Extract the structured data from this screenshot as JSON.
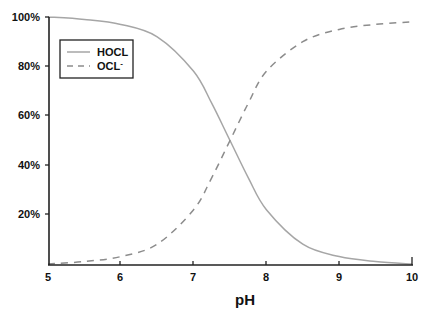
{
  "chart_data": {
    "type": "line",
    "title": "",
    "xlabel": "pH",
    "ylabel": "",
    "xlim": [
      5,
      10
    ],
    "ylim": [
      0,
      100
    ],
    "grid": false,
    "legend_position": "upper-left (inside)",
    "x_ticks": [
      "5",
      "6",
      "7",
      "8",
      "9",
      "10"
    ],
    "y_ticks": [
      "20%",
      "40%",
      "60%",
      "80%",
      "100%"
    ],
    "x": [
      5.0,
      5.5,
      6.0,
      6.5,
      7.0,
      7.25,
      7.5,
      7.75,
      8.0,
      8.5,
      9.0,
      9.5,
      10.0
    ],
    "series": [
      {
        "name": "HOCL",
        "style": "solid",
        "color": "#a6a6a6",
        "values": [
          100,
          99,
          97,
          92,
          78,
          65,
          50,
          35,
          22,
          8,
          3,
          1,
          0
        ]
      },
      {
        "name": "OCL-",
        "style": "dashed",
        "color": "#8c8c8c",
        "values": [
          0,
          1,
          3,
          8,
          22,
          35,
          50,
          65,
          78,
          90,
          95,
          97,
          98
        ]
      }
    ]
  },
  "legend": {
    "items": [
      {
        "label": "HOCL",
        "style": "solid"
      },
      {
        "label": "OCL",
        "superscript": "-",
        "style": "dashed"
      }
    ]
  },
  "axes": {
    "x_title": "pH",
    "x_ticks": [
      "5",
      "6",
      "7",
      "8",
      "9",
      "10"
    ],
    "y_ticks": [
      "100%",
      "80%",
      "60%",
      "40%",
      "20%"
    ]
  }
}
